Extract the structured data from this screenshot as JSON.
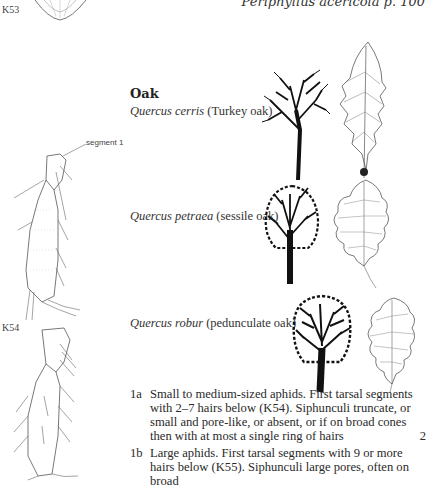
{
  "running_head": "Periphyllus acericola p. 100",
  "figures": {
    "k53_label": "K53",
    "k54_label": "K54",
    "k54_callout": "segment 1"
  },
  "section": {
    "title": "Oak",
    "species": [
      {
        "latin": "Quercus cerris",
        "common": "(Turkey oak)"
      },
      {
        "latin": "Quercus petraea",
        "common": "(sessile oak)"
      },
      {
        "latin": "Quercus robur",
        "common": "(pedunculate oak)"
      }
    ]
  },
  "key": [
    {
      "id": "1a",
      "text": "Small to medium-sized aphids. First tarsal segments with 2–7 hairs below (K54). Siphunculi truncate, or small and pore-like, or absent, or if on broad cones then with at most a single ring of hairs",
      "lead": "2"
    },
    {
      "id": "1b",
      "text": "Large aphids. First tarsal segments with 9 or more hairs below (K55). Siphunculi large pores, often on broad",
      "lead": ""
    }
  ]
}
